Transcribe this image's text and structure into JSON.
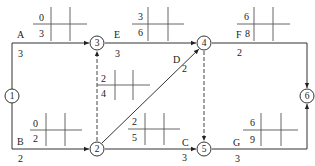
{
  "diagram": {
    "type": "activity-on-arrow network (double-code network) with time parameters",
    "nodes": [
      {
        "id": "1",
        "label": "1",
        "x": 12,
        "y": 96
      },
      {
        "id": "2",
        "label": "2",
        "x": 97,
        "y": 149
      },
      {
        "id": "3",
        "label": "3",
        "x": 97,
        "y": 43
      },
      {
        "id": "4",
        "label": "4",
        "x": 204,
        "y": 43
      },
      {
        "id": "5",
        "label": "5",
        "x": 204,
        "y": 149
      },
      {
        "id": "6",
        "label": "6",
        "x": 307,
        "y": 96
      }
    ],
    "activities": [
      {
        "name": "A",
        "from": "1",
        "to": "3",
        "duration": "3",
        "es": "0",
        "ef": "3"
      },
      {
        "name": "B",
        "from": "1",
        "to": "2",
        "duration": "2",
        "es": "0",
        "ef": "2"
      },
      {
        "name": "E",
        "from": "3",
        "to": "4",
        "duration": "3",
        "es": "3",
        "ef": "6"
      },
      {
        "name": "D",
        "from": "2",
        "to": "4",
        "duration": "2"
      },
      {
        "name": "C",
        "from": "2",
        "to": "5",
        "duration": "3",
        "es": "2",
        "ef": "5"
      },
      {
        "name": "F",
        "from": "4",
        "to": "6",
        "duration": "2",
        "es": "6",
        "ef": "8"
      },
      {
        "name": "G",
        "from": "5",
        "to": "6",
        "duration": "3",
        "es": "6",
        "ef": "9"
      }
    ],
    "dummies": [
      {
        "from": "2",
        "to": "3",
        "es": "2",
        "ef": "4"
      },
      {
        "from": "4",
        "to": "5"
      }
    ],
    "labels": {
      "A": "A",
      "A_dur": "3",
      "B": "B",
      "B_dur": "2",
      "E": "E",
      "E_dur": "3",
      "D": "D",
      "D_dur": "2",
      "C": "C",
      "C_dur": "3",
      "F": "F",
      "F_dur": "2",
      "G": "G",
      "G_dur": "3"
    },
    "params": {
      "A": {
        "top": "0",
        "bottom": "3"
      },
      "E": {
        "top": "3",
        "bottom": "6"
      },
      "F": {
        "top": "6",
        "bottom": "8"
      },
      "dummy23": {
        "top": "2",
        "bottom": "4"
      },
      "B": {
        "top": "0",
        "bottom": "2"
      },
      "C": {
        "top": "2",
        "bottom": "5"
      },
      "G": {
        "top": "6",
        "bottom": "9"
      }
    }
  }
}
